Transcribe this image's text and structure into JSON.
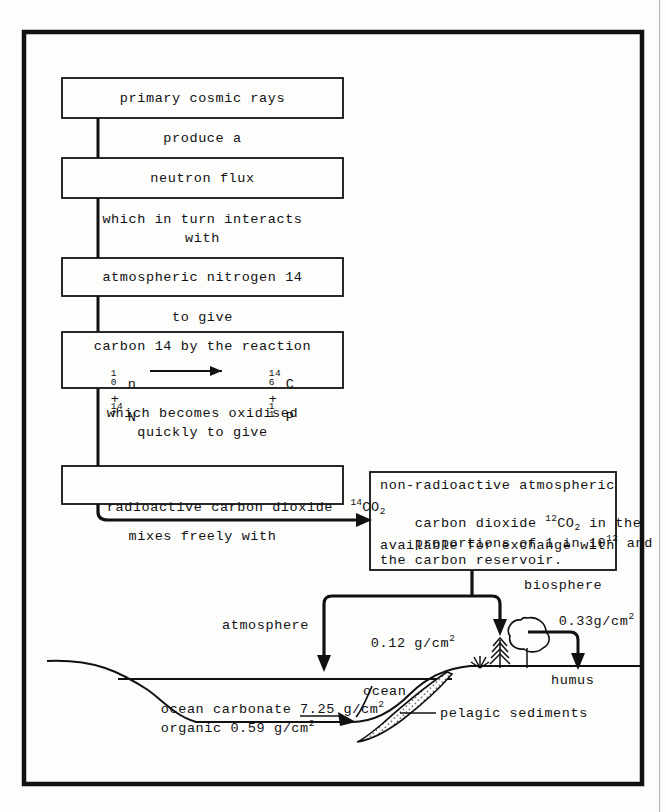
{
  "document": {
    "title": "Carbon-14 production and carbon reservoir exchange diagram",
    "type": "flow-diagram"
  },
  "chain": {
    "box1": {
      "label": "primary cosmic rays"
    },
    "note1": {
      "label": "produce a"
    },
    "box2": {
      "label": "neutron flux"
    },
    "note2_line1": {
      "label": "which in turn interacts"
    },
    "note2_line2": {
      "label": "with"
    },
    "box3": {
      "label": "atmospheric nitrogen 14"
    },
    "note3": {
      "label": "to give"
    },
    "box4": {
      "heading": "carbon 14 by the reaction",
      "equation": {
        "reactant1": {
          "mass": "1",
          "atomic": "0",
          "symbol": "n"
        },
        "plus1": "+",
        "reactant2": {
          "mass": "14",
          "atomic": "7",
          "symbol": "N"
        },
        "arrow": "→",
        "product1": {
          "mass": "14",
          "atomic": "6",
          "symbol": "C"
        },
        "plus2": "+",
        "product2": {
          "mass": "1",
          "atomic": "1",
          "symbol": "P"
        }
      }
    },
    "note4_line1": {
      "label": "which becomes oxidised"
    },
    "note4_line2": {
      "label": "quickly to give"
    },
    "box5": {
      "label": "radioactive carbon dioxide",
      "species_mass": "14",
      "species_symbol": "CO",
      "species_sub": "2"
    },
    "note5": {
      "label": "mixes freely with"
    }
  },
  "reservoir_box": {
    "line1": "non-radioactive atmospheric",
    "line2_a": "carbon dioxide",
    "line2_mass": "12",
    "line2_symbol": "CO",
    "line2_sub": "2",
    "line2_b": "in the",
    "line3_a": "proportions of 1 in 10",
    "line3_exp": "12",
    "line3_b": "and",
    "line4": "available for exchange with",
    "line5": "the carbon reservoir."
  },
  "reservoirs": {
    "atmosphere": {
      "label": "atmosphere",
      "value": "0.12 g/cm",
      "exponent": "2"
    },
    "biosphere": {
      "label": "biosphere",
      "value": "0.33g/cm",
      "exponent": "2"
    },
    "humus": {
      "label": "humus"
    },
    "ocean_carbonate": {
      "label": "ocean carbonate 7.25 g/cm",
      "exponent": "2"
    },
    "ocean_organic": {
      "label": "organic 0.59 g/cm",
      "exponent": "2"
    },
    "ocean": {
      "label": "ocean"
    },
    "pelagic_sediments": {
      "label": "pelagic sediments"
    }
  },
  "colors": {
    "ink": "#111111",
    "paper": "#fdfdfc",
    "frame": "#101010"
  }
}
